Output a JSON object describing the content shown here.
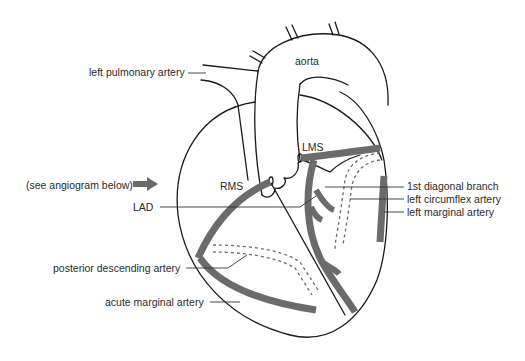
{
  "diagram": {
    "colors": {
      "outline": "#1a1a1a",
      "artery": "#6b6b6b",
      "text": "#2a2a2a",
      "background": "#ffffff"
    },
    "labels": {
      "aorta": "aorta",
      "left_pulmonary_artery": "left pulmonary artery",
      "lms": "LMS",
      "rms": "RMS",
      "see_angiogram": "(see angiogram below)",
      "lad": "LAD",
      "first_diagonal_branch": "1st diagonal branch",
      "left_circumflex_artery": "left circumflex artery",
      "left_marginal_artery": "left marginal artery",
      "posterior_descending_artery": "posterior descending artery",
      "acute_marginal_artery": "acute marginal artery"
    },
    "icons": {
      "pointer_arrow": "right-arrow-icon"
    }
  }
}
